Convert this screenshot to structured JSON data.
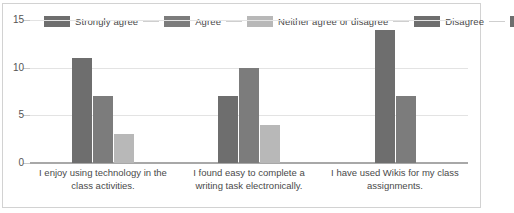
{
  "chart_data": {
    "type": "bar",
    "title": "",
    "xlabel": "",
    "ylabel": "",
    "ylim": [
      0,
      15
    ],
    "yticks": [
      0,
      5,
      10,
      15
    ],
    "grid": true,
    "legend_position": "top",
    "categories": [
      "I enjoy using technology in the class activities.",
      "I found easy to complete a writing task electronically.",
      "I have used Wikis for my class assignments."
    ],
    "series": [
      {
        "name": "Strongly agree",
        "color": "#6e6e6e",
        "values": [
          11,
          7,
          14
        ]
      },
      {
        "name": "Agree",
        "color": "#7c7c7c",
        "values": [
          7,
          10,
          7
        ]
      },
      {
        "name": "Neither agree or disagree",
        "color": "#b8b8b8",
        "values": [
          3,
          4,
          null
        ]
      },
      {
        "name": "Disagree",
        "color": "#6e6e6e",
        "values": [
          null,
          null,
          null
        ]
      }
    ],
    "legend": [
      {
        "label": "Strongly agree",
        "color": "#6e6e6e"
      },
      {
        "label": "Agree",
        "color": "#7c7c7c"
      },
      {
        "label": "Neither agree or disagree",
        "color": "#b8b8b8"
      },
      {
        "label": "Disagree",
        "color": "#6e6e6e"
      }
    ],
    "legend_truncated_swatch": {
      "label": "",
      "color": "#6e6e6e"
    }
  },
  "axis": {
    "y_tick_labels": [
      "15",
      "10",
      "5",
      "0"
    ]
  }
}
